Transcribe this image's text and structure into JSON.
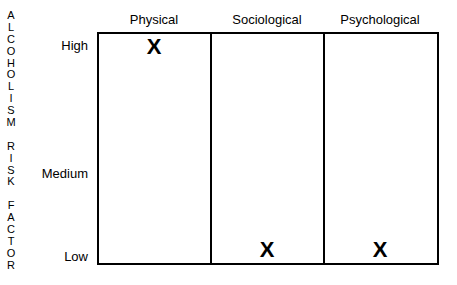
{
  "y_axis_title_letters": [
    "A",
    "L",
    "C",
    "O",
    "H",
    "O",
    "L",
    "I",
    "S",
    "M",
    " ",
    "R",
    "I",
    "S",
    "K",
    " ",
    "F",
    "A",
    "C",
    "T",
    "O",
    "R"
  ],
  "y_levels": [
    {
      "label": "High",
      "y": 46
    },
    {
      "label": "Medium",
      "y": 174
    },
    {
      "label": "Low",
      "y": 257
    }
  ],
  "columns": [
    {
      "label": "Physical",
      "center": 154
    },
    {
      "label": "Sociological",
      "center": 267
    },
    {
      "label": "Psychological",
      "center": 380
    }
  ],
  "marks": [
    {
      "symbol": "X",
      "column": "Physical",
      "level": "High",
      "x": 154,
      "y": 47
    },
    {
      "symbol": "X",
      "column": "Sociological",
      "level": "Low",
      "x": 267,
      "y": 250
    },
    {
      "symbol": "X",
      "column": "Psychological",
      "level": "Low",
      "x": 380,
      "y": 250
    }
  ]
}
